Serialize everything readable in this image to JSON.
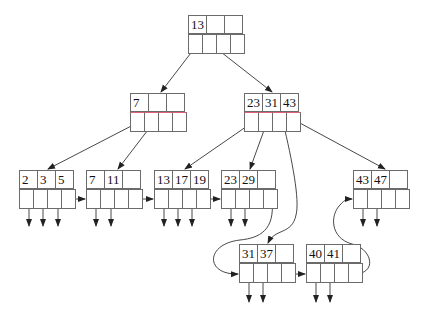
{
  "diagram": {
    "type": "B+ tree",
    "root": {
      "id": "root",
      "keys": [
        "13",
        "",
        ""
      ],
      "x": 188,
      "y": 15
    },
    "internal": [
      {
        "id": "int-left",
        "keys": [
          "7",
          "",
          ""
        ],
        "x": 130,
        "y": 93
      },
      {
        "id": "int-right",
        "keys": [
          "23",
          "31",
          "43"
        ],
        "x": 244,
        "y": 93
      }
    ],
    "leaves": [
      {
        "id": "leaf-1",
        "keys": [
          "2",
          "3",
          "5"
        ],
        "x": 19,
        "y": 170
      },
      {
        "id": "leaf-2",
        "keys": [
          "7",
          "11",
          ""
        ],
        "x": 86,
        "y": 170
      },
      {
        "id": "leaf-3",
        "keys": [
          "13",
          "17",
          "19"
        ],
        "x": 154,
        "y": 170
      },
      {
        "id": "leaf-4",
        "keys": [
          "23",
          "29",
          ""
        ],
        "x": 221,
        "y": 170
      },
      {
        "id": "leaf-5",
        "keys": [
          "31",
          "37",
          ""
        ],
        "x": 239,
        "y": 244
      },
      {
        "id": "leaf-6",
        "keys": [
          "40",
          "41",
          ""
        ],
        "x": 306,
        "y": 244
      },
      {
        "id": "leaf-7",
        "keys": [
          "43",
          "47",
          ""
        ],
        "x": 353,
        "y": 170
      }
    ],
    "colors": {
      "line": "#6b6b6b",
      "arrow": "#222222",
      "accent_edge": "#e0607a"
    }
  }
}
